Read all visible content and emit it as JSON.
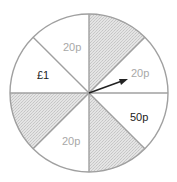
{
  "spinner": {
    "sectors": [
      {
        "position": "N-NE",
        "label": "",
        "shaded": true
      },
      {
        "position": "NE-E",
        "label": "20p",
        "shaded": false
      },
      {
        "position": "E-SE",
        "label": "50p",
        "shaded": false
      },
      {
        "position": "SE-S",
        "label": "",
        "shaded": true
      },
      {
        "position": "S-SW",
        "label": "20p",
        "shaded": false
      },
      {
        "position": "SW-W",
        "label": "",
        "shaded": true
      },
      {
        "position": "W-NW",
        "label": "£1",
        "shaded": false
      },
      {
        "position": "NW-N",
        "label": "20p",
        "shaded": false
      }
    ],
    "labels": {
      "nw_n": "20p",
      "ne_e": "20p",
      "e_se": "50p",
      "s_sw": "20p",
      "w_nw": "£1"
    },
    "colors": {
      "outline": "#a0a0a0",
      "shade": "#d9d9d9",
      "label_gray": "#a8a8a8",
      "label_dark": "#222222",
      "arrow": "#222222"
    }
  }
}
